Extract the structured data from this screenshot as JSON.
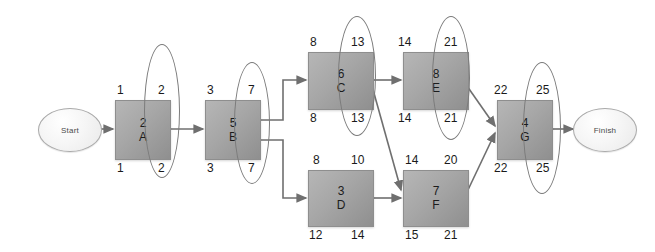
{
  "diagram": {
    "type": "activity-on-node-network",
    "start_label": "Start",
    "finish_label": "Finish",
    "box_fill": "#a6a6a6",
    "line_color": "#7b7b7b",
    "text_color": "#1a1a1a"
  },
  "nodes": [
    {
      "id": "A",
      "name": "A",
      "duration": "2",
      "es": "1",
      "ef": "2",
      "ls": "1",
      "lf": "2",
      "critical": true,
      "x": 115,
      "y": 100,
      "w": 54,
      "h": 58
    },
    {
      "id": "B",
      "name": "B",
      "duration": "5",
      "es": "3",
      "ef": "7",
      "ls": "3",
      "lf": "7",
      "critical": true,
      "x": 205,
      "y": 100,
      "w": 54,
      "h": 58
    },
    {
      "id": "C",
      "name": "C",
      "duration": "6",
      "es": "8",
      "ef": "13",
      "ls": "8",
      "lf": "13",
      "critical": true,
      "x": 308,
      "y": 52,
      "w": 64,
      "h": 56
    },
    {
      "id": "E",
      "name": "E",
      "duration": "8",
      "es": "14",
      "ef": "21",
      "ls": "14",
      "lf": "21",
      "critical": true,
      "x": 403,
      "y": 52,
      "w": 64,
      "h": 56
    },
    {
      "id": "D",
      "name": "D",
      "duration": "3",
      "es": "8",
      "ef": "10",
      "ls": "12",
      "lf": "14",
      "critical": false,
      "x": 308,
      "y": 170,
      "w": 64,
      "h": 55
    },
    {
      "id": "F",
      "name": "F",
      "duration": "7",
      "es": "14",
      "ef": "20",
      "ls": "15",
      "lf": "21",
      "critical": false,
      "x": 403,
      "y": 170,
      "w": 64,
      "h": 55
    },
    {
      "id": "G",
      "name": "G",
      "duration": "4",
      "es": "22",
      "ef": "25",
      "ls": "22",
      "lf": "25",
      "critical": true,
      "x": 497,
      "y": 100,
      "w": 54,
      "h": 58
    }
  ],
  "edges": [
    {
      "from": "Start",
      "to": "A"
    },
    {
      "from": "A",
      "to": "B"
    },
    {
      "from": "B",
      "to": "C"
    },
    {
      "from": "B",
      "to": "D"
    },
    {
      "from": "C",
      "to": "E"
    },
    {
      "from": "C",
      "to": "F"
    },
    {
      "from": "D",
      "to": "F"
    },
    {
      "from": "E",
      "to": "G"
    },
    {
      "from": "F",
      "to": "G"
    },
    {
      "from": "G",
      "to": "Finish"
    }
  ]
}
